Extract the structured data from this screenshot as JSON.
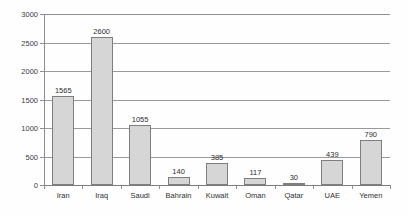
{
  "chart_data": {
    "type": "bar",
    "title": "",
    "subtitle": "",
    "xlabel": "",
    "ylabel": "",
    "categories": [
      "Iran",
      "Iraq",
      "Saudi",
      "Bahrain",
      "Kuwait",
      "Oman",
      "Qatar",
      "UAE",
      "Yemen"
    ],
    "values": [
      1565,
      2600,
      1055,
      140,
      385,
      117,
      30,
      439,
      790
    ],
    "value_labels": [
      "1565",
      "2600",
      "1055",
      "140",
      "385",
      "117",
      "30",
      "439",
      "790"
    ],
    "ylim": [
      0,
      3000
    ],
    "yticks": [
      0,
      500,
      1000,
      1500,
      2000,
      2500,
      3000
    ],
    "ytick_labels": [
      "0",
      "500",
      "1000",
      "1500",
      "2000",
      "2500",
      "3000"
    ],
    "grid": true,
    "legend": false,
    "legend_position": "none",
    "bar_color": "#d6d6d6",
    "bar_border_color": "#7e7e7e",
    "gridline_color": "#9a9a9a",
    "axis_color": "#8e8e8e",
    "text_color": "#2f2f2f",
    "background_color": "#fefefe"
  }
}
